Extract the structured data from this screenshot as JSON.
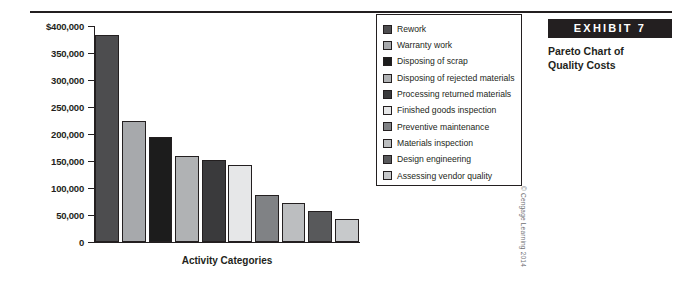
{
  "exhibit": {
    "badge_label": "EXHIBIT 7",
    "title_line1": "Pareto Chart of",
    "title_line2": "Quality Costs"
  },
  "credit": "© Cengage Learning 2014",
  "chart_data": {
    "type": "bar",
    "title": "Pareto Chart of Quality Costs",
    "xlabel": "Activity Categories",
    "ylabel": "",
    "ylim": [
      0,
      400000
    ],
    "grid": false,
    "legend_position": "right",
    "ytick_labels": [
      "$400,000",
      "350,000",
      "300,000",
      "250,000",
      "200,000",
      "150,000",
      "100,000",
      "50,000",
      "0"
    ],
    "ytick_values": [
      400000,
      350000,
      300000,
      250000,
      200000,
      150000,
      100000,
      50000,
      0
    ],
    "categories": [
      "Rework",
      "Warranty work",
      "Disposing of scrap",
      "Disposing of rejected materials",
      "Processing returned materials",
      "Finished goods inspection",
      "Preventive maintenance",
      "Materials inspection",
      "Design engineering",
      "Assessing vendor quality"
    ],
    "values": [
      383000,
      225000,
      195000,
      160000,
      151000,
      143000,
      87000,
      72000,
      58000,
      43000
    ],
    "colors": [
      "#4d4d4f",
      "#a7a9ac",
      "#1c1c1c",
      "#b0b2b4",
      "#3a3a3c",
      "#e6e7e8",
      "#808285",
      "#bcbec0",
      "#58595b",
      "#c7c9cb"
    ]
  }
}
